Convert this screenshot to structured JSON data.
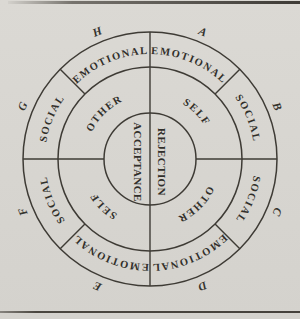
{
  "figure": {
    "type": "concentric-ring-taxonomy-diagram",
    "colors": {
      "paper": "#d8d6d1",
      "ink": "#3e3b35",
      "text": "#312f2a"
    },
    "center_circle": {
      "left_label": "ACCEPTANCE",
      "right_label": "REJECTION"
    },
    "middle_ring_quadrants": [
      {
        "position": "top-left",
        "label": "OTHER"
      },
      {
        "position": "top-right",
        "label": "SELF"
      },
      {
        "position": "bottom-right",
        "label": "OTHER"
      },
      {
        "position": "bottom-left",
        "label": "SELF"
      }
    ],
    "outer_ring_sectors": [
      {
        "letter": "A",
        "position": "top-right",
        "label": "EMOTIONAL"
      },
      {
        "letter": "B",
        "position": "right-upper",
        "label": "SOCIAL"
      },
      {
        "letter": "C",
        "position": "right-lower",
        "label": "SOCIAL"
      },
      {
        "letter": "D",
        "position": "bottom-right",
        "label": "EMOTIONAL"
      },
      {
        "letter": "E",
        "position": "bottom-left",
        "label": "EMOTIONAL"
      },
      {
        "letter": "F",
        "position": "left-lower",
        "label": "SOCIAL"
      },
      {
        "letter": "G",
        "position": "left-upper",
        "label": "SOCIAL"
      },
      {
        "letter": "H",
        "position": "top-left",
        "label": "EMOTIONAL"
      }
    ]
  }
}
